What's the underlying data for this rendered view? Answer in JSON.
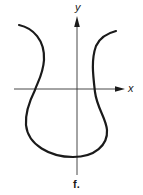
{
  "figure": {
    "caption": "f.",
    "x_axis_label": "x",
    "y_axis_label": "y",
    "colors": {
      "stroke": "#1a1a1a",
      "axis": "#333333",
      "background": "#ffffff"
    },
    "curve": {
      "description": "Closed-bottom U/goblet-shaped curve with two flared upper branches, symmetric-ish about the y-axis, crossing the x-axis twice"
    }
  }
}
